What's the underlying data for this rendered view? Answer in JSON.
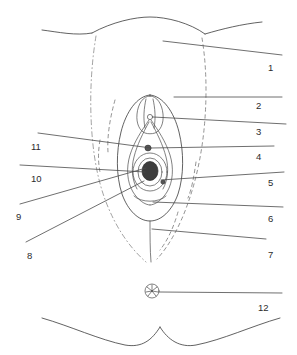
{
  "figure": {
    "width": 297,
    "height": 355,
    "background_color": "#ffffff",
    "line_color": "#3a3a3a",
    "label_color": "#2b2b2b"
  },
  "callouts": {
    "right": [
      {
        "id": "callout-1",
        "number": "1",
        "x": 268,
        "y": 63
      },
      {
        "id": "callout-2",
        "number": "2",
        "x": 256,
        "y": 101
      },
      {
        "id": "callout-3",
        "number": "3",
        "x": 256,
        "y": 127
      },
      {
        "id": "callout-4",
        "number": "4",
        "x": 256,
        "y": 152
      },
      {
        "id": "callout-5",
        "number": "5",
        "x": 268,
        "y": 178
      },
      {
        "id": "callout-6",
        "number": "6",
        "x": 268,
        "y": 214
      },
      {
        "id": "callout-7",
        "number": "7",
        "x": 268,
        "y": 250
      },
      {
        "id": "callout-12",
        "number": "12",
        "x": 258,
        "y": 303
      }
    ],
    "left": [
      {
        "id": "callout-11",
        "number": "11",
        "x": 31,
        "y": 142
      },
      {
        "id": "callout-10",
        "number": "10",
        "x": 31,
        "y": 174
      },
      {
        "id": "callout-9",
        "number": "9",
        "x": 16,
        "y": 212
      },
      {
        "id": "callout-8",
        "number": "8",
        "x": 27,
        "y": 251
      }
    ]
  },
  "structures": [
    {
      "id": "mons-pubis-arc",
      "name": "mons pubis contour"
    },
    {
      "id": "groin-fold-left",
      "name": "left groin fold"
    },
    {
      "id": "groin-fold-right",
      "name": "right groin fold"
    },
    {
      "id": "labia-majora-left-dashed",
      "name": "left labium majus outline"
    },
    {
      "id": "labia-majora-right-dashed",
      "name": "right labium majus outline"
    },
    {
      "id": "clitoral-hood",
      "name": "clitoral hood / prepuce"
    },
    {
      "id": "glans-clitoris",
      "name": "glans of clitoris"
    },
    {
      "id": "urethral-opening",
      "name": "external urethral orifice"
    },
    {
      "id": "vaginal-opening",
      "name": "vaginal orifice"
    },
    {
      "id": "labia-minora",
      "name": "labia minora"
    },
    {
      "id": "vestibule",
      "name": "vestibule"
    },
    {
      "id": "perineum",
      "name": "perineum"
    },
    {
      "id": "anus",
      "name": "anus"
    },
    {
      "id": "thigh-fold-left",
      "name": "left thigh / buttock fold"
    },
    {
      "id": "thigh-fold-right",
      "name": "right thigh / buttock fold"
    }
  ]
}
